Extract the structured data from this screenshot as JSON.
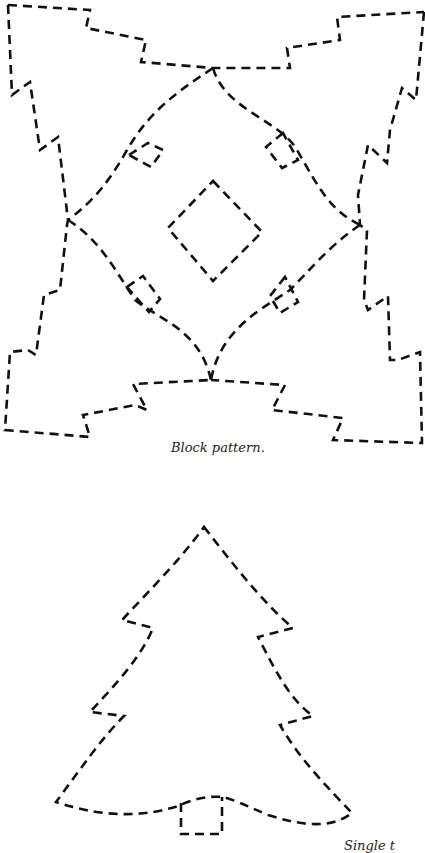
{
  "document": {
    "type": "quilt/sewing template page",
    "figures": [
      {
        "id": "block-pattern",
        "caption": "Block pattern.",
        "description": "Four dashed-outline Christmas tree shapes arranged around a central diamond, with small square notches on the inner curves"
      },
      {
        "id": "single-tree",
        "caption": "Single t",
        "description": "Dashed-outline single Christmas tree with trunk (caption clipped at image edge)"
      }
    ]
  },
  "style": {
    "line_color": "#111111",
    "background": "#ffffff"
  }
}
